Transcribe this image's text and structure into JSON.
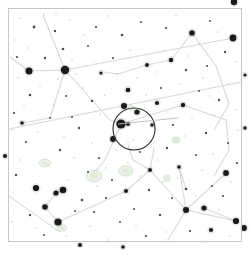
{
  "app": {
    "title": "Star Chart",
    "view_type": "sky-map",
    "background_color": "#ffffff",
    "frame_color": "#c8c8c8",
    "star_color": "#1a1a1a",
    "constellation_line_color": "#d8d8d8",
    "ecliptic_line_color": "#d0d0d0",
    "fov_circle_color": "#2b2b2b",
    "dso_color": "#b9cdb2",
    "faint_star_color": "#9a9a9a"
  },
  "frame": {
    "x": 8,
    "y": 8,
    "width": 233,
    "height": 233,
    "stroke_width": 1
  },
  "chart_data": {
    "type": "scatter",
    "title": "",
    "xlabel": "",
    "ylabel": "",
    "xlim": [
      0,
      249
    ],
    "ylim": [
      0,
      256
    ],
    "grid": false,
    "legend": "none",
    "bright_stars": [
      {
        "x": 65,
        "y": 70,
        "mag": 2.1,
        "r": 4.2
      },
      {
        "x": 29,
        "y": 71,
        "mag": 2.6,
        "r": 3.5
      },
      {
        "x": 234,
        "y": 2,
        "mag": 2.8,
        "r": 3.2
      },
      {
        "x": 233,
        "y": 38,
        "mag": 2.9,
        "r": 3.4
      },
      {
        "x": 192,
        "y": 33,
        "mag": 3.3,
        "r": 2.8
      },
      {
        "x": 171,
        "y": 60,
        "mag": 3.6,
        "r": 2.2
      },
      {
        "x": 147,
        "y": 65,
        "mag": 3.9,
        "r": 1.9
      },
      {
        "x": 124,
        "y": 106,
        "mag": 3.1,
        "r": 3.0
      },
      {
        "x": 137,
        "y": 112,
        "mag": 3.4,
        "r": 2.6
      },
      {
        "x": 121,
        "y": 124,
        "mag": 2.4,
        "r": 4.6
      },
      {
        "x": 128,
        "y": 124,
        "mag": 3.8,
        "r": 2.0
      },
      {
        "x": 113,
        "y": 139,
        "mag": 3.2,
        "r": 2.9
      },
      {
        "x": 128,
        "y": 90,
        "mag": 3.5,
        "r": 2.3
      },
      {
        "x": 157,
        "y": 103,
        "mag": 3.7,
        "r": 2.1
      },
      {
        "x": 183,
        "y": 105,
        "mag": 3.6,
        "r": 2.2
      },
      {
        "x": 36,
        "y": 188,
        "mag": 3.0,
        "r": 3.1
      },
      {
        "x": 56,
        "y": 193,
        "mag": 3.4,
        "r": 2.6
      },
      {
        "x": 63,
        "y": 190,
        "mag": 2.9,
        "r": 3.3
      },
      {
        "x": 45,
        "y": 207,
        "mag": 3.3,
        "r": 2.8
      },
      {
        "x": 58,
        "y": 222,
        "mag": 2.7,
        "r": 3.6
      },
      {
        "x": 126,
        "y": 191,
        "mag": 3.9,
        "r": 2.0
      },
      {
        "x": 226,
        "y": 173,
        "mag": 3.2,
        "r": 2.9
      },
      {
        "x": 186,
        "y": 210,
        "mag": 3.1,
        "r": 3.0
      },
      {
        "x": 204,
        "y": 208,
        "mag": 3.4,
        "r": 2.6
      },
      {
        "x": 236,
        "y": 221,
        "mag": 3.0,
        "r": 3.1
      },
      {
        "x": 244,
        "y": 228,
        "mag": 3.2,
        "r": 2.9
      },
      {
        "x": 211,
        "y": 230,
        "mag": 3.7,
        "r": 2.1
      },
      {
        "x": 179,
        "y": 167,
        "mag": 4.0,
        "r": 1.8
      },
      {
        "x": 150,
        "y": 170,
        "mag": 3.8,
        "r": 2.0
      },
      {
        "x": 152,
        "y": 125,
        "mag": 4.1,
        "r": 1.7
      },
      {
        "x": 101,
        "y": 73,
        "mag": 4.2,
        "r": 1.6
      },
      {
        "x": 22,
        "y": 123,
        "mag": 4.0,
        "r": 1.8
      },
      {
        "x": 5,
        "y": 156,
        "mag": 3.9,
        "r": 2.0
      },
      {
        "x": 245,
        "y": 128,
        "mag": 4.1,
        "r": 1.7
      },
      {
        "x": 245,
        "y": 75,
        "mag": 4.2,
        "r": 1.6
      },
      {
        "x": 80,
        "y": 245,
        "mag": 3.9,
        "r": 2.0
      },
      {
        "x": 123,
        "y": 247,
        "mag": 4.0,
        "r": 1.8
      }
    ],
    "medium_stars": [
      {
        "x": 34,
        "y": 27,
        "r": 1.4
      },
      {
        "x": 55,
        "y": 31,
        "r": 1.2
      },
      {
        "x": 96,
        "y": 27,
        "r": 1.1
      },
      {
        "x": 122,
        "y": 35,
        "r": 1.3
      },
      {
        "x": 141,
        "y": 22,
        "r": 1.0
      },
      {
        "x": 166,
        "y": 28,
        "r": 1.1
      },
      {
        "x": 210,
        "y": 21,
        "r": 1.0
      },
      {
        "x": 225,
        "y": 52,
        "r": 1.2
      },
      {
        "x": 63,
        "y": 49,
        "r": 1.3
      },
      {
        "x": 17,
        "y": 57,
        "r": 1.1
      },
      {
        "x": 45,
        "y": 58,
        "r": 1.2
      },
      {
        "x": 88,
        "y": 46,
        "r": 1.0
      },
      {
        "x": 113,
        "y": 58,
        "r": 1.1
      },
      {
        "x": 186,
        "y": 70,
        "r": 1.2
      },
      {
        "x": 207,
        "y": 66,
        "r": 1.0
      },
      {
        "x": 30,
        "y": 95,
        "r": 1.3
      },
      {
        "x": 66,
        "y": 96,
        "r": 1.1
      },
      {
        "x": 92,
        "y": 101,
        "r": 1.2
      },
      {
        "x": 161,
        "y": 88,
        "r": 1.1
      },
      {
        "x": 199,
        "y": 91,
        "r": 1.0
      },
      {
        "x": 219,
        "y": 100,
        "r": 1.2
      },
      {
        "x": 14,
        "y": 113,
        "r": 1.1
      },
      {
        "x": 50,
        "y": 118,
        "r": 1.0
      },
      {
        "x": 79,
        "y": 128,
        "r": 1.2
      },
      {
        "x": 173,
        "y": 125,
        "r": 1.1
      },
      {
        "x": 206,
        "y": 133,
        "r": 1.2
      },
      {
        "x": 228,
        "y": 143,
        "r": 1.0
      },
      {
        "x": 26,
        "y": 142,
        "r": 1.1
      },
      {
        "x": 60,
        "y": 150,
        "r": 1.2
      },
      {
        "x": 99,
        "y": 158,
        "r": 1.1
      },
      {
        "x": 140,
        "y": 152,
        "r": 1.0
      },
      {
        "x": 167,
        "y": 148,
        "r": 1.2
      },
      {
        "x": 196,
        "y": 155,
        "r": 1.1
      },
      {
        "x": 16,
        "y": 175,
        "r": 1.2
      },
      {
        "x": 88,
        "y": 172,
        "r": 1.0
      },
      {
        "x": 112,
        "y": 180,
        "r": 1.1
      },
      {
        "x": 149,
        "y": 190,
        "r": 1.2
      },
      {
        "x": 212,
        "y": 186,
        "r": 1.0
      },
      {
        "x": 30,
        "y": 215,
        "r": 1.2
      },
      {
        "x": 94,
        "y": 212,
        "r": 1.1
      },
      {
        "x": 120,
        "y": 222,
        "r": 1.0
      },
      {
        "x": 160,
        "y": 215,
        "r": 1.2
      },
      {
        "x": 190,
        "y": 231,
        "r": 1.1
      },
      {
        "x": 44,
        "y": 235,
        "r": 1.0
      },
      {
        "x": 146,
        "y": 236,
        "r": 1.1
      },
      {
        "x": 72,
        "y": 117,
        "r": 1.0
      },
      {
        "x": 186,
        "y": 189,
        "r": 1.3
      },
      {
        "x": 134,
        "y": 209,
        "r": 1.0
      },
      {
        "x": 106,
        "y": 198,
        "r": 1.1
      },
      {
        "x": 172,
        "y": 198,
        "r": 1.0
      },
      {
        "x": 223,
        "y": 196,
        "r": 1.1
      },
      {
        "x": 82,
        "y": 200,
        "r": 1.3
      },
      {
        "x": 75,
        "y": 211,
        "r": 1.0
      },
      {
        "x": 237,
        "y": 163,
        "r": 1.1
      }
    ],
    "faint_stars": [
      {
        "x": 20,
        "y": 18
      },
      {
        "x": 44,
        "y": 14
      },
      {
        "x": 70,
        "y": 20
      },
      {
        "x": 84,
        "y": 35
      },
      {
        "x": 108,
        "y": 16
      },
      {
        "x": 130,
        "y": 50
      },
      {
        "x": 152,
        "y": 40
      },
      {
        "x": 176,
        "y": 15
      },
      {
        "x": 199,
        "y": 44
      },
      {
        "x": 218,
        "y": 32
      },
      {
        "x": 236,
        "y": 62
      },
      {
        "x": 14,
        "y": 40
      },
      {
        "x": 28,
        "y": 48
      },
      {
        "x": 72,
        "y": 60
      },
      {
        "x": 94,
        "y": 62
      },
      {
        "x": 117,
        "y": 74
      },
      {
        "x": 137,
        "y": 78
      },
      {
        "x": 157,
        "y": 72
      },
      {
        "x": 180,
        "y": 84
      },
      {
        "x": 203,
        "y": 78
      },
      {
        "x": 228,
        "y": 84
      },
      {
        "x": 18,
        "y": 78
      },
      {
        "x": 40,
        "y": 86
      },
      {
        "x": 54,
        "y": 105
      },
      {
        "x": 83,
        "y": 88
      },
      {
        "x": 105,
        "y": 95
      },
      {
        "x": 146,
        "y": 95
      },
      {
        "x": 168,
        "y": 112
      },
      {
        "x": 192,
        "y": 118
      },
      {
        "x": 214,
        "y": 115
      },
      {
        "x": 236,
        "y": 110
      },
      {
        "x": 12,
        "y": 130
      },
      {
        "x": 38,
        "y": 132
      },
      {
        "x": 64,
        "y": 137
      },
      {
        "x": 92,
        "y": 143
      },
      {
        "x": 116,
        "y": 150
      },
      {
        "x": 133,
        "y": 140
      },
      {
        "x": 154,
        "y": 143
      },
      {
        "x": 185,
        "y": 136
      },
      {
        "x": 213,
        "y": 154
      },
      {
        "x": 238,
        "y": 130
      },
      {
        "x": 20,
        "y": 160
      },
      {
        "x": 48,
        "y": 165
      },
      {
        "x": 74,
        "y": 158
      },
      {
        "x": 106,
        "y": 168
      },
      {
        "x": 128,
        "y": 163
      },
      {
        "x": 158,
        "y": 160
      },
      {
        "x": 178,
        "y": 178
      },
      {
        "x": 202,
        "y": 170
      },
      {
        "x": 231,
        "y": 182
      },
      {
        "x": 13,
        "y": 192
      },
      {
        "x": 40,
        "y": 176
      },
      {
        "x": 68,
        "y": 180
      },
      {
        "x": 97,
        "y": 186
      },
      {
        "x": 140,
        "y": 176
      },
      {
        "x": 163,
        "y": 182
      },
      {
        "x": 196,
        "y": 196
      },
      {
        "x": 219,
        "y": 210
      },
      {
        "x": 12,
        "y": 222
      },
      {
        "x": 36,
        "y": 228
      },
      {
        "x": 66,
        "y": 236
      },
      {
        "x": 90,
        "y": 226
      },
      {
        "x": 108,
        "y": 240
      },
      {
        "x": 136,
        "y": 226
      },
      {
        "x": 166,
        "y": 232
      },
      {
        "x": 206,
        "y": 242
      },
      {
        "x": 230,
        "y": 236
      },
      {
        "x": 56,
        "y": 14
      },
      {
        "x": 188,
        "y": 56
      },
      {
        "x": 100,
        "y": 114
      },
      {
        "x": 148,
        "y": 114
      },
      {
        "x": 128,
        "y": 142
      },
      {
        "x": 58,
        "y": 79
      },
      {
        "x": 210,
        "y": 96
      },
      {
        "x": 24,
        "y": 106
      },
      {
        "x": 76,
        "y": 74
      },
      {
        "x": 164,
        "y": 50
      },
      {
        "x": 112,
        "y": 88
      }
    ],
    "constellation_lines": [
      {
        "name": "line-a",
        "points": [
          [
            10,
            57
          ],
          [
            29,
            71
          ],
          [
            65,
            70
          ]
        ]
      },
      {
        "name": "line-b",
        "points": [
          [
            65,
            70
          ],
          [
            43,
            15
          ]
        ]
      },
      {
        "name": "line-c",
        "points": [
          [
            65,
            70
          ],
          [
            233,
            38
          ]
        ]
      },
      {
        "name": "line-d",
        "points": [
          [
            65,
            70
          ],
          [
            50,
            118
          ],
          [
            22,
            123
          ]
        ]
      },
      {
        "name": "line-e",
        "points": [
          [
            65,
            70
          ],
          [
            110,
            120
          ],
          [
            121,
            124
          ]
        ]
      },
      {
        "name": "line-f",
        "points": [
          [
            121,
            124
          ],
          [
            183,
            105
          ],
          [
            226,
            120
          ]
        ]
      },
      {
        "name": "line-g",
        "points": [
          [
            147,
            65
          ],
          [
            171,
            60
          ],
          [
            192,
            33
          ]
        ]
      },
      {
        "name": "line-h",
        "points": [
          [
            192,
            33
          ],
          [
            216,
            66
          ],
          [
            229,
            104
          ],
          [
            214,
            130
          ]
        ]
      },
      {
        "name": "line-i",
        "points": [
          [
            147,
            65
          ],
          [
            118,
            74
          ],
          [
            104,
            72
          ]
        ]
      },
      {
        "name": "line-j",
        "points": [
          [
            121,
            124
          ],
          [
            105,
            160
          ],
          [
            92,
            175
          ]
        ]
      },
      {
        "name": "line-k",
        "points": [
          [
            226,
            120
          ],
          [
            229,
            150
          ],
          [
            214,
            176
          ]
        ]
      },
      {
        "name": "line-l",
        "points": [
          [
            150,
            170
          ],
          [
            186,
            210
          ],
          [
            226,
            173
          ]
        ]
      },
      {
        "name": "line-m",
        "points": [
          [
            186,
            210
          ],
          [
            236,
            221
          ]
        ]
      },
      {
        "name": "line-n",
        "points": [
          [
            186,
            210
          ],
          [
            179,
            167
          ],
          [
            186,
            189
          ]
        ]
      },
      {
        "name": "line-o",
        "points": [
          [
            150,
            170
          ],
          [
            133,
            160
          ],
          [
            128,
            145
          ]
        ]
      },
      {
        "name": "line-p",
        "points": [
          [
            186,
            210
          ],
          [
            168,
            240
          ]
        ]
      },
      {
        "name": "line-q",
        "points": [
          [
            56,
            193
          ],
          [
            45,
            207
          ],
          [
            58,
            222
          ],
          [
            126,
            191
          ]
        ]
      },
      {
        "name": "line-r",
        "points": [
          [
            126,
            191
          ],
          [
            150,
            170
          ]
        ]
      },
      {
        "name": "line-s",
        "points": [
          [
            63,
            190
          ],
          [
            56,
            193
          ]
        ]
      },
      {
        "name": "line-t",
        "points": [
          [
            150,
            170
          ],
          [
            154,
            148
          ]
        ]
      },
      {
        "name": "line-u",
        "points": [
          [
            204,
            208
          ],
          [
            236,
            221
          ]
        ]
      }
    ],
    "reference_lines": [
      {
        "name": "ecliptic",
        "points": [
          [
            9,
            129
          ],
          [
            241,
            82
          ]
        ]
      },
      {
        "name": "ecliptic-lower",
        "points": [
          [
            9,
            196
          ],
          [
            60,
            232
          ]
        ]
      }
    ],
    "deep_sky_objects": [
      {
        "x": 45,
        "y": 163,
        "rx": 9,
        "ry": 6,
        "label": ""
      },
      {
        "x": 94,
        "y": 176,
        "rx": 12,
        "ry": 9,
        "label": ""
      },
      {
        "x": 126,
        "y": 171,
        "rx": 11,
        "ry": 8,
        "label": ""
      },
      {
        "x": 62,
        "y": 228,
        "rx": 7,
        "ry": 5,
        "label": ""
      },
      {
        "x": 176,
        "y": 140,
        "rx": 6,
        "ry": 5,
        "label": ""
      },
      {
        "x": 131,
        "y": 108,
        "rx": 4,
        "ry": 4,
        "label": ""
      },
      {
        "x": 167,
        "y": 178,
        "rx": 5,
        "ry": 5,
        "label": ""
      }
    ],
    "fov_marker": {
      "name": "field-of-view-circle",
      "cx": 134,
      "cy": 129,
      "r": 21,
      "stroke_width": 1.1
    },
    "fov_crosshair": {
      "x1": 118,
      "y1": 124,
      "x2": 178,
      "y2": 118
    }
  }
}
